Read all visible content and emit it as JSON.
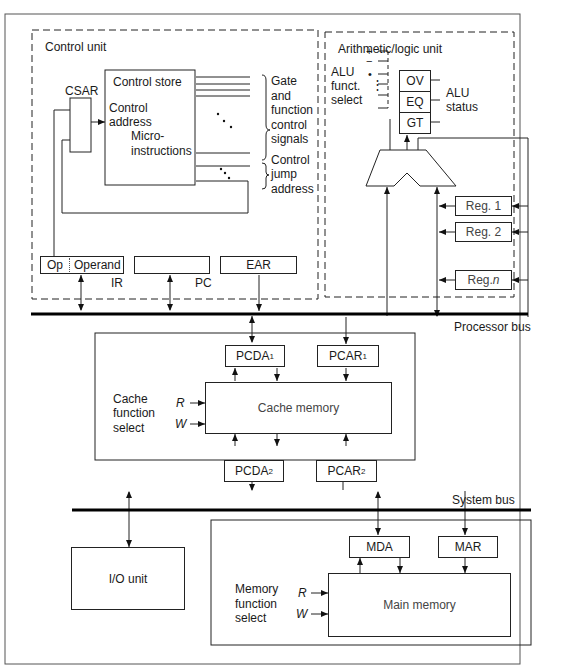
{
  "control_unit": {
    "title": "Control unit",
    "csar": "CSAR",
    "control_store": "Control store",
    "control_address_1": "Control",
    "control_address_2": "address",
    "micro_1": "Micro-",
    "micro_2": "instructions",
    "gate_signals": [
      "Gate",
      "and",
      "function",
      "control",
      "signals"
    ],
    "jump_address": [
      "Control",
      "jump",
      "address"
    ],
    "ir": {
      "op": "Op",
      "operand": "Operand",
      "label": "IR"
    },
    "pc": {
      "label": "PC"
    },
    "ear": {
      "label": "EAR"
    }
  },
  "alu": {
    "title": "Arithmetic/logic unit",
    "funct_select": [
      "ALU",
      "funct.",
      "select"
    ],
    "funct_symbols": [
      "+",
      "−",
      "•",
      ":"
    ],
    "status_label": [
      "ALU",
      "status"
    ],
    "status_flags": [
      "OV",
      "EQ",
      "GT"
    ],
    "registers": [
      "Reg. 1",
      "Reg. 2",
      "Reg. "
    ],
    "reg_n": "n"
  },
  "buses": {
    "processor": "Processor bus",
    "system": "System bus"
  },
  "cache": {
    "function_select": [
      "Cache",
      "function",
      "select"
    ],
    "r": "R",
    "w": "W",
    "memory": "Cache memory",
    "pcda1": "PCDA",
    "pcar1": "PCAR",
    "pcda2": "PCDA",
    "pcar2": "PCAR",
    "sub1": "1",
    "sub2": "2"
  },
  "io": {
    "label": "I/O unit"
  },
  "main_memory": {
    "function_select": [
      "Memory",
      "function",
      "select"
    ],
    "r": "R",
    "w": "W",
    "label": "Main memory",
    "mda": "MDA",
    "mar": "MAR"
  }
}
